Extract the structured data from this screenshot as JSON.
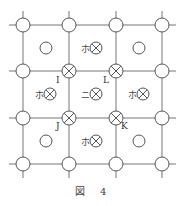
{
  "caption": "図 4",
  "grid": {
    "xs": [
      23,
      69,
      116,
      162
    ],
    "ys": [
      25,
      71,
      118,
      164
    ],
    "line_color": "#777777"
  },
  "nodes": [
    {
      "x": 23,
      "y": 25,
      "type": "circle"
    },
    {
      "x": 69,
      "y": 25,
      "type": "circle"
    },
    {
      "x": 116,
      "y": 25,
      "type": "circle"
    },
    {
      "x": 162,
      "y": 25,
      "type": "circle"
    },
    {
      "x": 23,
      "y": 71,
      "type": "circle"
    },
    {
      "x": 69,
      "y": 71,
      "type": "cross",
      "label": "I"
    },
    {
      "x": 116,
      "y": 71,
      "type": "cross",
      "label": "L"
    },
    {
      "x": 162,
      "y": 71,
      "type": "circle"
    },
    {
      "x": 23,
      "y": 118,
      "type": "circle"
    },
    {
      "x": 69,
      "y": 118,
      "type": "cross",
      "label": "J"
    },
    {
      "x": 116,
      "y": 118,
      "type": "cross",
      "label": "K"
    },
    {
      "x": 162,
      "y": 118,
      "type": "circle"
    },
    {
      "x": 23,
      "y": 164,
      "type": "circle"
    },
    {
      "x": 69,
      "y": 164,
      "type": "circle"
    },
    {
      "x": 116,
      "y": 164,
      "type": "circle"
    },
    {
      "x": 162,
      "y": 164,
      "type": "circle"
    }
  ],
  "cells": [
    {
      "x": 46,
      "y": 48,
      "type": "circle"
    },
    {
      "x": 92,
      "y": 48,
      "type": "cross",
      "prefix": "ホ"
    },
    {
      "x": 139,
      "y": 48,
      "type": "circle"
    },
    {
      "x": 46,
      "y": 94,
      "type": "cross",
      "prefix": "ホ"
    },
    {
      "x": 92,
      "y": 94,
      "type": "cross",
      "prefix": "ニ"
    },
    {
      "x": 139,
      "y": 94,
      "type": "cross",
      "prefix": "ホ"
    },
    {
      "x": 46,
      "y": 141,
      "type": "circle"
    },
    {
      "x": 92,
      "y": 141,
      "type": "cross",
      "prefix": "ホ"
    },
    {
      "x": 139,
      "y": 141,
      "type": "circle"
    }
  ],
  "labels": {
    "I": "I",
    "L": "L",
    "J": "J",
    "K": "K"
  }
}
